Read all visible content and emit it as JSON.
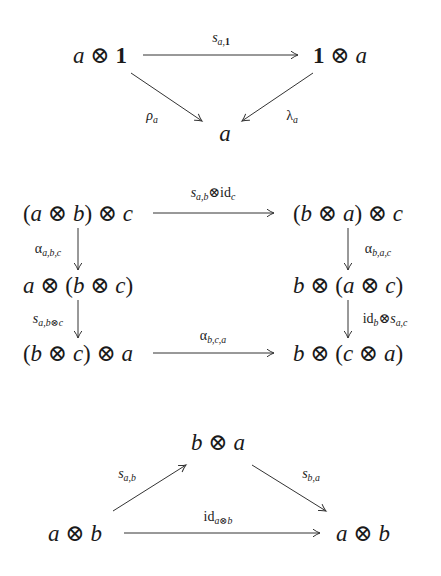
{
  "diagrams": [
    {
      "name": "unit-symmetry-triangle",
      "nodes": {
        "left": {
          "text": "a ⊗ 1",
          "x": 100,
          "y": 55
        },
        "right": {
          "text": "1 ⊗ a",
          "x": 340,
          "y": 55
        },
        "bottom": {
          "text": "a",
          "x": 225,
          "y": 132
        }
      },
      "arrows": [
        {
          "from": "a ⊗ 1",
          "to": "1 ⊗ a",
          "label": "s_{a,1}",
          "x1": 143,
          "y1": 55,
          "x2": 298,
          "y2": 55
        },
        {
          "from": "a ⊗ 1",
          "to": "a",
          "label": "ρ_a",
          "x1": 131,
          "y1": 73,
          "x2": 202,
          "y2": 121
        },
        {
          "from": "1 ⊗ a",
          "to": "a",
          "label": "λ_a",
          "x1": 313,
          "y1": 73,
          "x2": 242,
          "y2": 121
        }
      ],
      "labels": {
        "top": {
          "base": "s",
          "sub": "a,1",
          "x": 221,
          "y": 38
        },
        "left": {
          "base": "ρ",
          "sub": "a",
          "x": 152,
          "y": 117
        },
        "right": {
          "base": "λ",
          "sub": "a",
          "x": 292,
          "y": 117
        }
      }
    },
    {
      "name": "hexagon-braiding-diagram",
      "nodes": {
        "tl": {
          "parts": [
            "(",
            "a",
            " ⊗ ",
            "b",
            ") ⊗ ",
            "c"
          ],
          "x": 78,
          "y": 213
        },
        "tr": {
          "parts": [
            "(",
            "b",
            " ⊗ ",
            "a",
            ") ⊗ ",
            "c"
          ],
          "x": 348,
          "y": 213
        },
        "ml": {
          "parts": [
            "",
            "a",
            " ⊗ (",
            "b",
            " ⊗ ",
            "c",
            ")"
          ],
          "x": 78,
          "y": 285
        },
        "mr": {
          "parts": [
            "",
            "b",
            " ⊗ (",
            "a",
            " ⊗ ",
            "c",
            ")"
          ],
          "x": 348,
          "y": 285
        },
        "bl": {
          "parts": [
            "(",
            "b",
            " ⊗ ",
            "c",
            ") ⊗ ",
            "a"
          ],
          "x": 78,
          "y": 353
        },
        "br": {
          "parts": [
            "",
            "b",
            " ⊗ (",
            "c",
            " ⊗ ",
            "a",
            ")"
          ],
          "x": 348,
          "y": 353
        }
      },
      "arrows": [
        {
          "label": "s_{a,b} ⊗ id_c",
          "x1": 153,
          "y1": 213,
          "x2": 274,
          "y2": 213
        },
        {
          "label": "α_{a,b,c}",
          "x1": 78,
          "y1": 228,
          "x2": 78,
          "y2": 270
        },
        {
          "label": "α_{b,a,c}",
          "x1": 348,
          "y1": 228,
          "x2": 348,
          "y2": 270
        },
        {
          "label": "s_{a,b⊗c}",
          "x1": 78,
          "y1": 300,
          "x2": 78,
          "y2": 338
        },
        {
          "label": "id_b ⊗ s_{a,c}",
          "x1": 348,
          "y1": 300,
          "x2": 348,
          "y2": 338
        },
        {
          "label": "α_{b,c,a}",
          "x1": 153,
          "y1": 353,
          "x2": 274,
          "y2": 353
        }
      ],
      "labels": {
        "top": {
          "text": "s_{a,b}⊗id_c",
          "x": 213,
          "y": 192
        },
        "left1": {
          "base": "α",
          "sub": "a,b,c",
          "x": 48,
          "y": 249
        },
        "right1": {
          "base": "α",
          "sub": "b,a,c",
          "x": 378,
          "y": 249
        },
        "left2": {
          "base": "s",
          "sub": "a,b⊗c",
          "x": 48,
          "y": 319
        },
        "right2": {
          "text": "id_b⊗s_{a,c}",
          "x": 385,
          "y": 319
        },
        "bottom": {
          "base": "α",
          "sub": "b,c,a",
          "x": 213,
          "y": 336
        }
      }
    },
    {
      "name": "symmetry-involution-triangle",
      "nodes": {
        "top": {
          "parts": [
            "b",
            " ⊗ ",
            "a"
          ],
          "x": 218,
          "y": 442
        },
        "left": {
          "parts": [
            "a",
            " ⊗ ",
            "b"
          ],
          "x": 75,
          "y": 533
        },
        "right": {
          "parts": [
            "a",
            " ⊗ ",
            "b"
          ],
          "x": 363,
          "y": 533
        }
      },
      "arrows": [
        {
          "label": "s_{a,b}",
          "x1": 113,
          "y1": 511,
          "x2": 186,
          "y2": 465
        },
        {
          "label": "s_{b,a}",
          "x1": 252,
          "y1": 465,
          "x2": 326,
          "y2": 511
        },
        {
          "label": "id_{a⊗b}",
          "x1": 124,
          "y1": 533,
          "x2": 320,
          "y2": 533
        }
      ],
      "labels": {
        "left": {
          "base": "s",
          "sub": "a,b",
          "x": 127,
          "y": 475
        },
        "right": {
          "base": "s",
          "sub": "b,a",
          "x": 311,
          "y": 475
        },
        "bottom": {
          "text": "id_{a⊗b}",
          "x": 218,
          "y": 517
        }
      }
    }
  ],
  "colors": {
    "ink": "#1a1a1a",
    "arrow": "#333333",
    "background": "#ffffff"
  }
}
